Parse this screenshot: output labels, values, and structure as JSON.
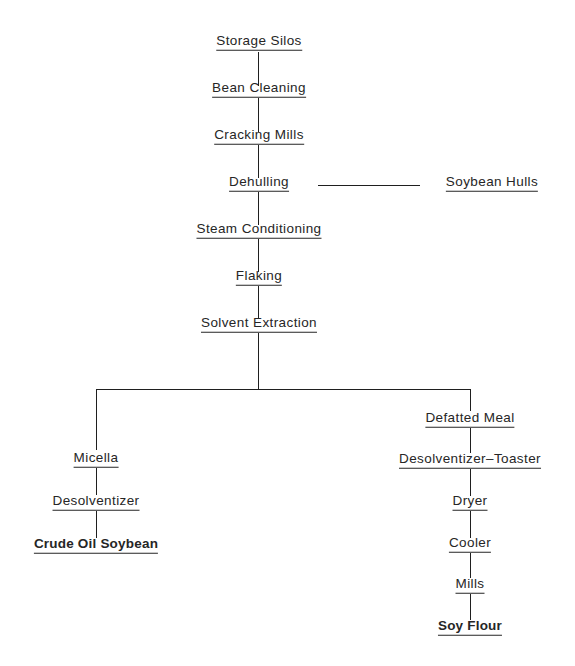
{
  "diagram": {
    "type": "flowchart",
    "orientation": "top-to-bottom",
    "background_color": "#ffffff",
    "line_color": "#1f1f1f",
    "text_color": "#262626",
    "nodes": {
      "storage_silos": "Storage Silos",
      "bean_cleaning": "Bean Cleaning",
      "cracking_mills": "Cracking Mills",
      "dehulling": "Dehulling",
      "soybean_hulls": "Soybean Hulls",
      "steam_conditioning": "Steam Conditioning",
      "flaking": "Flaking",
      "solvent_extraction": "Solvent Extraction",
      "micella": "Micella",
      "desolventizer": "Desolventizer",
      "crude_oil_soybean": "Crude Oil Soybean",
      "defatted_meal": "Defatted Meal",
      "desolventizer_toaster": "Desolventizer–Toaster",
      "dryer": "Dryer",
      "cooler": "Cooler",
      "mills": "Mills",
      "soy_flour": "Soy Flour"
    },
    "emphasized_nodes": [
      "Crude Oil Soybean",
      "Soy Flour"
    ],
    "edges": [
      [
        "Storage Silos",
        "Bean Cleaning"
      ],
      [
        "Bean Cleaning",
        "Cracking Mills"
      ],
      [
        "Cracking Mills",
        "Dehulling"
      ],
      [
        "Dehulling",
        "Soybean Hulls"
      ],
      [
        "Dehulling",
        "Steam Conditioning"
      ],
      [
        "Steam Conditioning",
        "Flaking"
      ],
      [
        "Flaking",
        "Solvent Extraction"
      ],
      [
        "Solvent Extraction",
        "Micella"
      ],
      [
        "Solvent Extraction",
        "Defatted Meal"
      ],
      [
        "Micella",
        "Desolventizer"
      ],
      [
        "Desolventizer",
        "Crude Oil Soybean"
      ],
      [
        "Defatted Meal",
        "Desolventizer–Toaster"
      ],
      [
        "Desolventizer–Toaster",
        "Dryer"
      ],
      [
        "Dryer",
        "Cooler"
      ],
      [
        "Cooler",
        "Mills"
      ],
      [
        "Mills",
        "Soy Flour"
      ]
    ]
  }
}
